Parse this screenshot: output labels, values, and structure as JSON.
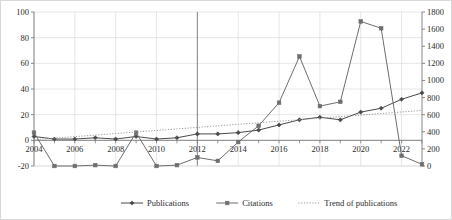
{
  "chart_data": {
    "type": "line",
    "title": "",
    "xlabel": "",
    "ylabel": "",
    "y2label": "",
    "grid": true,
    "legend_position": "bottom",
    "x": [
      2004,
      2005,
      2006,
      2007,
      2008,
      2009,
      2010,
      2011,
      2012,
      2013,
      2014,
      2015,
      2016,
      2017,
      2018,
      2019,
      2020,
      2021,
      2022,
      2023
    ],
    "xticklabels": [
      "2004",
      "2006",
      "2008",
      "2010",
      "2012",
      "2014",
      "2016",
      "2018",
      "2020",
      "2022"
    ],
    "xtickvalues": [
      2004,
      2006,
      2008,
      2010,
      2012,
      2014,
      2016,
      2018,
      2020,
      2022
    ],
    "ylim": [
      -20,
      100
    ],
    "yticks": [
      -20,
      0,
      20,
      40,
      60,
      80,
      100
    ],
    "yticklabels": [
      "-20",
      "0",
      "20",
      "40",
      "60",
      "80",
      "100"
    ],
    "y2lim": [
      0,
      1800
    ],
    "y2ticks": [
      0,
      200,
      400,
      600,
      800,
      1000,
      1200,
      1400,
      1600,
      1800
    ],
    "y2ticklabels": [
      "0",
      "200",
      "400",
      "600",
      "800",
      "1000",
      "1200",
      "1400",
      "1600",
      "1800"
    ],
    "series": [
      {
        "name": "Publications",
        "axis": "left",
        "style": "solid",
        "marker": "diamond",
        "color": "#4a4a4a",
        "values": [
          3,
          1,
          1,
          2,
          1,
          3,
          1,
          2,
          5,
          5,
          6,
          8,
          12,
          16,
          18,
          16,
          22,
          25,
          32,
          37
        ]
      },
      {
        "name": "Citations",
        "axis": "right",
        "style": "solid",
        "marker": "square",
        "color": "#6e6e6e",
        "values": [
          390,
          0,
          0,
          10,
          0,
          390,
          0,
          10,
          100,
          60,
          280,
          470,
          740,
          1280,
          700,
          750,
          1690,
          1610,
          120,
          20
        ]
      },
      {
        "name": "Trend of publications",
        "axis": "left",
        "style": "dotted",
        "marker": "none",
        "color": "#9a9a9a",
        "values": [
          0.5,
          1.7,
          2.9,
          4.1,
          5.3,
          6.5,
          7.7,
          8.9,
          10.1,
          11.3,
          12.5,
          13.7,
          14.9,
          16.1,
          17.3,
          18.5,
          19.7,
          20.9,
          22.1,
          23.3
        ]
      }
    ],
    "legend": [
      {
        "label": "Publications",
        "style": "solid",
        "marker": "diamond",
        "color": "#4a4a4a"
      },
      {
        "label": "Citations",
        "style": "solid",
        "marker": "square",
        "color": "#6e6e6e"
      },
      {
        "label": "Trend of publications",
        "style": "dotted",
        "marker": "none",
        "color": "#9a9a9a"
      }
    ],
    "emphasis_gridline_x": 2012,
    "colors": {
      "grid": "#dcdcdc",
      "emphasis_grid": "#8c8c8c",
      "axis": "#7a7a7a",
      "text": "#2b2b2b",
      "background": "#ffffff"
    }
  }
}
